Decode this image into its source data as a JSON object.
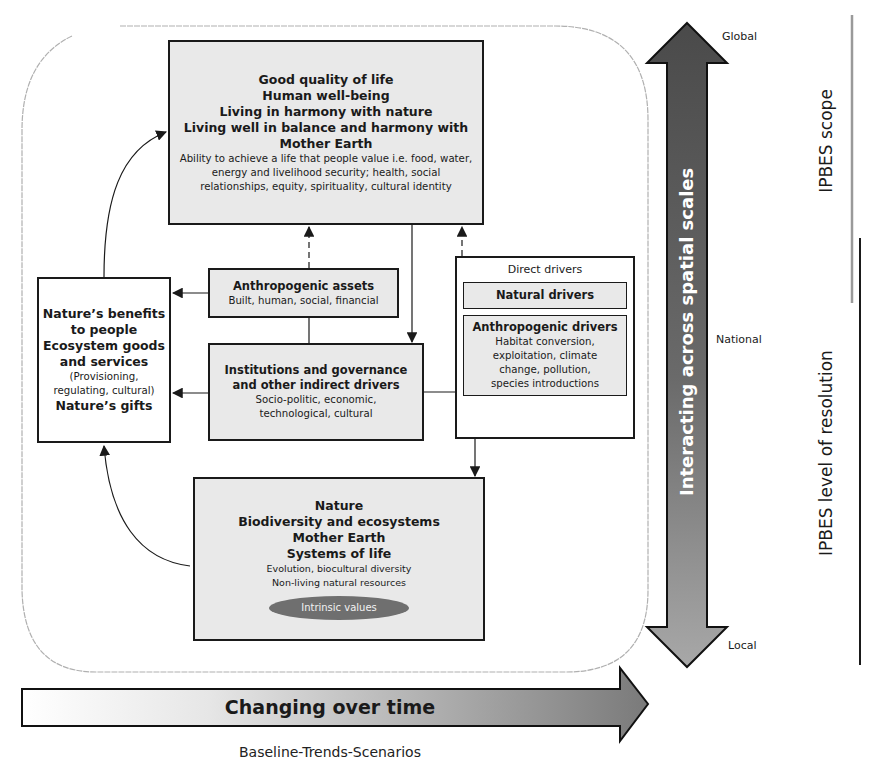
{
  "top_box": {
    "titles": [
      "Good quality of life",
      "Human well-being",
      "Living in harmony with nature",
      "Living well in balance and harmony with",
      "Mother Earth"
    ],
    "details": [
      "Ability to achieve a life that people value i.e. food, water,",
      "energy and livelihood security; health, social",
      "relationships, equity, spirituality, cultural identity"
    ]
  },
  "benefits_box": {
    "lines": [
      "Nature’s benefits",
      "to people",
      "Ecosystem goods",
      "and services"
    ],
    "detail": [
      "(Provisioning,",
      "regulating, cultural)"
    ],
    "last": "Nature’s gifts"
  },
  "assets_box": {
    "title": "Anthropogenic assets",
    "detail": "Built, human, social, financial"
  },
  "institutions_box": {
    "titles": [
      "Institutions and governance",
      "and other indirect drivers"
    ],
    "details": [
      "Socio-politic, economic,",
      "technological, cultural"
    ]
  },
  "direct_drivers_box": {
    "title": "Direct drivers",
    "natural": "Natural drivers",
    "anthropogenic_title": "Anthropogenic drivers",
    "anthropogenic_details": [
      "Habitat conversion,",
      "exploitation, climate",
      "change, pollution,",
      "species introductions"
    ]
  },
  "nature_box": {
    "titles": [
      "Nature",
      "Biodiversity and ecosystems",
      "Mother Earth",
      "Systems of life"
    ],
    "details": [
      "Evolution, biocultural diversity",
      "Non-living natural resources"
    ],
    "badge": "Intrinsic values"
  },
  "vertical_arrow": {
    "label": "Interacting across spatial scales",
    "scale_top": "Global",
    "scale_mid": "National",
    "scale_bottom": "Local"
  },
  "horizontal_arrow": {
    "label": "Changing over time",
    "caption": "Baseline-Trends-Scenarios"
  },
  "right_labels": {
    "scope": "IPBES scope",
    "resolution": "IPBES level of resolution"
  },
  "colors": {
    "box_fill": "#e9e9e9",
    "arrow_dark": "#555555",
    "arrow_mid": "#8c8c8c",
    "badge_fill": "#6f6f6f",
    "scope_line": "#9a9a9a",
    "resolution_line": "#1a1a1a"
  }
}
